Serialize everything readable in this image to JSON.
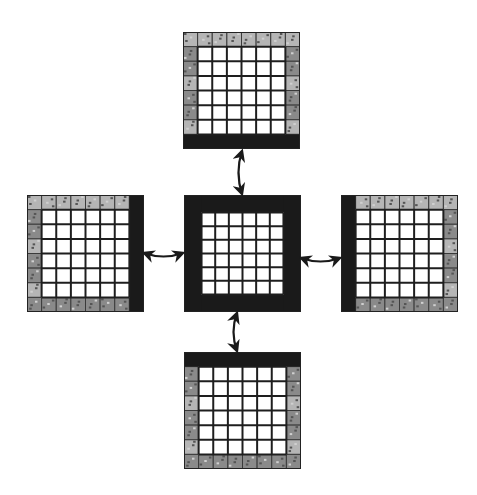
{
  "diagram": {
    "type": "grid-block-neighbor-exchange",
    "grid_cells_per_side": 8,
    "interior_cells_per_side": 6,
    "colors": {
      "background": "#ffffff",
      "halo_cell": "#8a8a8a",
      "halo_cell_light": "#b5b5b5",
      "solid_border": "#1a1a1a",
      "interior_cell": "#ffffff",
      "grid_line": "#1e1e1e"
    },
    "blocks": [
      {
        "id": "top",
        "x": 183,
        "y": 32,
        "size": 117,
        "solid_sides": [
          "bottom"
        ]
      },
      {
        "id": "left",
        "x": 27,
        "y": 195,
        "size": 117,
        "solid_sides": [
          "right"
        ]
      },
      {
        "id": "center",
        "x": 184,
        "y": 195,
        "size": 117,
        "solid_sides": [
          "top",
          "right",
          "bottom",
          "left"
        ]
      },
      {
        "id": "right",
        "x": 341,
        "y": 195,
        "size": 117,
        "solid_sides": [
          "left"
        ]
      },
      {
        "id": "bottom",
        "x": 184,
        "y": 352,
        "size": 117,
        "solid_sides": [
          "top"
        ]
      }
    ],
    "arrows": [
      {
        "id": "top-center",
        "from": [
          242,
          151
        ],
        "to": [
          242,
          194
        ],
        "bidirectional": true
      },
      {
        "id": "left-center",
        "from": [
          144,
          253
        ],
        "to": [
          183,
          253
        ],
        "bidirectional": true
      },
      {
        "id": "right-center",
        "from": [
          301,
          258
        ],
        "to": [
          340,
          258
        ],
        "bidirectional": true
      },
      {
        "id": "bottom-center",
        "from": [
          237,
          313
        ],
        "to": [
          237,
          351
        ],
        "bidirectional": true
      }
    ]
  }
}
